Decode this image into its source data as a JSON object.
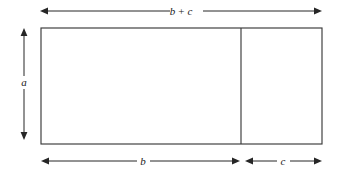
{
  "figure": {
    "type": "geometry-diagram",
    "background_color": "#ffffff",
    "stroke_color": "#3a3a3a",
    "label_color": "#1a1a1a"
  },
  "labels": {
    "top": {
      "name": "total-width",
      "text": "b + c",
      "term_left": "b",
      "operator": "+",
      "term_right": "c"
    },
    "left": {
      "name": "height",
      "text": "a"
    },
    "bottom_left": {
      "name": "left-width",
      "text": "b"
    },
    "bottom_right": {
      "name": "right-width",
      "text": "c"
    }
  },
  "geometry": {
    "rect": {
      "x": 41,
      "y": 28,
      "width": 281,
      "height": 116
    },
    "divider_x": 241,
    "top_arrow": {
      "x1": 40,
      "x2": 322,
      "y": 11,
      "gap_start": 170,
      "gap_end": 203
    },
    "left_arrow": {
      "x": 24,
      "y1": 28,
      "y2": 140,
      "gap_start": 76,
      "gap_end": 89
    },
    "bottom_arrow_b": {
      "x1": 41,
      "x2": 240,
      "y": 161,
      "gap_start": 137,
      "gap_end": 150
    },
    "bottom_arrow_c": {
      "x1": 245,
      "x2": 322,
      "y": 161,
      "gap_start": 277,
      "gap_end": 290
    }
  }
}
